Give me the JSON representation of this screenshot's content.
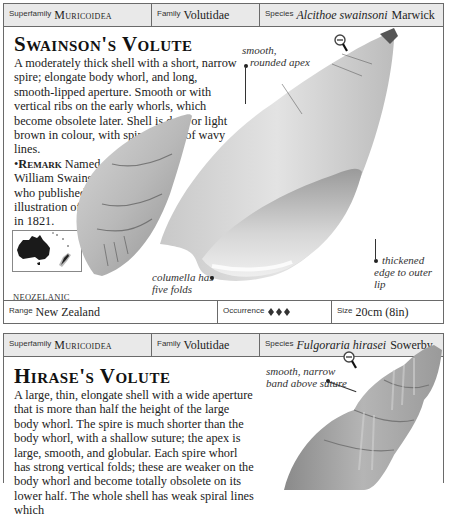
{
  "entry1": {
    "header": {
      "superfamily_label": "Superfamily",
      "superfamily": "Muricoidea",
      "family_label": "Family",
      "family": "Volutidae",
      "species_label": "Species",
      "species_italic": "Alcithoe swainsoni",
      "species_author": "Marwick"
    },
    "title": "Swainson's Volute",
    "description": "A moderately thick shell with a short, narrow spire; elongate body whorl, and long, smooth-lipped aperture. Smooth or with vertical ribs on the early whorls, which become obsolete later. Shell is dark or light brown in colour, with spiral bands of wavy lines.",
    "remark_label": "Remark",
    "remark": "Named after William Swainson, who published the first illustration of the shell in 1821.",
    "habitat_label": "Habitat",
    "habitat": "Offshore.",
    "map_label": "NEOZELANIC",
    "annotations": {
      "apex": [
        "smooth,",
        "rounded apex"
      ],
      "columella": [
        "columella has",
        "five folds"
      ],
      "lip": [
        "thickened",
        "edge to outer lip"
      ]
    },
    "footer": {
      "range_label": "Range",
      "range": "New Zealand",
      "occurrence_label": "Occurrence",
      "occurrence_icons": "shell-icon x3",
      "size_label": "Size",
      "size": "20cm (8in)"
    }
  },
  "entry2": {
    "header": {
      "superfamily_label": "Superfamily",
      "superfamily": "Muricoidea",
      "family_label": "Family",
      "family": "Volutidae",
      "species_label": "Species",
      "species_italic": "Fulgoraria hirasei",
      "species_author": "Sowerby"
    },
    "title": "Hirase's Volute",
    "description": "A large, thin, elongate shell with a wide aperture that is more than half the height of the large body whorl. The spire is much shorter than the body whorl, with a shallow suture; the apex is large, smooth, and globular. Each spire whorl has strong vertical folds; these are weaker on the body whorl and become totally obsolete on its lower half. The whole shell has weak spiral lines which",
    "annotations": {
      "suture": [
        "smooth, narrow",
        "band above suture"
      ]
    }
  }
}
